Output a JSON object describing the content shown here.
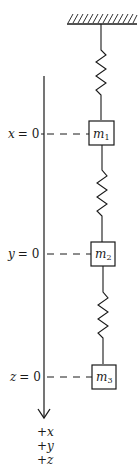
{
  "diagram": {
    "type": "spring-mass-system",
    "colors": {
      "ink": "#1a1a1a",
      "background": "#ffffff"
    },
    "support": {
      "name": "fixed-ceiling"
    },
    "springs": [
      {
        "id": "k1",
        "from": "ceiling",
        "to": "m1"
      },
      {
        "id": "k2",
        "from": "m1",
        "to": "m2"
      },
      {
        "id": "k3",
        "from": "m2",
        "to": "m3"
      }
    ],
    "masses": [
      {
        "id": "m1",
        "symbol": "m",
        "subscript": "1",
        "coordinate": "x",
        "origin_label": "x = 0",
        "var": "x",
        "eq": "= 0"
      },
      {
        "id": "m2",
        "symbol": "m",
        "subscript": "2",
        "coordinate": "y",
        "origin_label": "y = 0",
        "var": "y",
        "eq": "= 0"
      },
      {
        "id": "m3",
        "symbol": "m",
        "subscript": "3",
        "coordinate": "z",
        "origin_label": "z = 0",
        "var": "z",
        "eq": "= 0"
      }
    ],
    "axis": {
      "direction": "down",
      "positive_labels": [
        "+x",
        "+y",
        "+z"
      ]
    }
  }
}
